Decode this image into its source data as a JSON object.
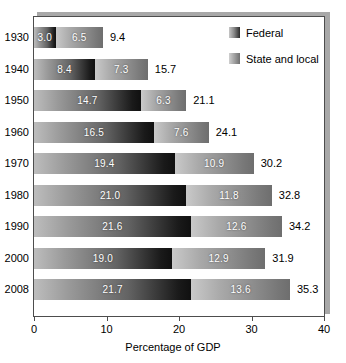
{
  "chart_data": {
    "type": "bar",
    "orientation": "horizontal",
    "stacked": true,
    "title": "",
    "xlabel": "Percentage of GDP",
    "ylabel": "",
    "xlim": [
      0,
      40
    ],
    "xticks": [
      0,
      10,
      20,
      30,
      40
    ],
    "xtick_labels": [
      "0",
      "10",
      "20",
      "30",
      "40"
    ],
    "grid": false,
    "legend_position": "top-right",
    "categories": [
      "1930",
      "1940",
      "1950",
      "1960",
      "1970",
      "1980",
      "1990",
      "2000",
      "2008"
    ],
    "series": [
      {
        "name": "Federal",
        "color": "#1a1a1a",
        "values": [
          3.0,
          8.4,
          14.7,
          16.5,
          19.4,
          21.0,
          21.6,
          19.0,
          21.7
        ],
        "labels": [
          "3.0",
          "8.4",
          "14.7",
          "16.5",
          "19.4",
          "21.0",
          "21.6",
          "19.0",
          "21.7"
        ]
      },
      {
        "name": "State and local",
        "color": "#8e8e8e",
        "values": [
          6.5,
          7.3,
          6.3,
          7.6,
          10.9,
          11.8,
          12.6,
          12.9,
          13.6
        ],
        "labels": [
          "6.5",
          "7.3",
          "6.3",
          "7.6",
          "10.9",
          "11.8",
          "12.6",
          "12.9",
          "13.6"
        ]
      }
    ],
    "totals": [
      9.4,
      15.7,
      21.1,
      24.1,
      30.2,
      32.8,
      34.2,
      31.9,
      35.3
    ],
    "total_labels": [
      "9.4",
      "15.7",
      "21.1",
      "24.1",
      "30.2",
      "32.8",
      "34.2",
      "31.9",
      "35.3"
    ]
  },
  "legend": {
    "items": [
      {
        "label": "Federal",
        "swatch": "federal"
      },
      {
        "label": "State and local",
        "swatch": "state"
      }
    ]
  },
  "axis": {
    "x_title": "Percentage of GDP"
  }
}
